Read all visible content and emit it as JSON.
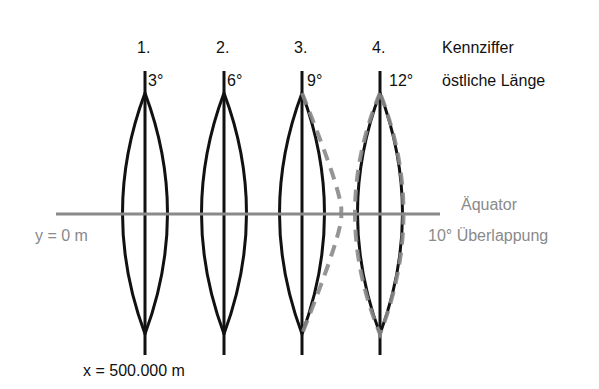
{
  "diagram": {
    "type": "UTM zone strips (Gauss-Krüger meridian strips) with overlap",
    "header": {
      "index_label": "Kennziffer",
      "longitude_label": "östliche Länge"
    },
    "strips": [
      {
        "index": "1.",
        "meridian": "3°",
        "center_x": 145
      },
      {
        "index": "2.",
        "meridian": "6°",
        "center_x": 224
      },
      {
        "index": "3.",
        "meridian": "9°",
        "center_x": 302
      },
      {
        "index": "4.",
        "meridian": "12°",
        "center_x": 380
      }
    ],
    "equator_label": "Äquator",
    "y_origin_label": "y = 0 m",
    "overlap_label": "10° Überlappung",
    "x_false_easting_label": "x = 500.000 m",
    "colors": {
      "strip_outline": "#111111",
      "equator_line": "#8a8a8a",
      "overlap_dashed": "#8a8a8a",
      "gray_text": "#8a8a8a",
      "text": "#111111",
      "background": "#ffffff"
    }
  }
}
